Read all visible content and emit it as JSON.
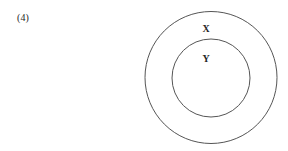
{
  "figure": {
    "item_number": "(4)",
    "background_color": "#ffffff",
    "stroke_color": "#555555",
    "label_color": "#262626",
    "stroke_width": 1,
    "width": 288,
    "height": 151
  },
  "chart_data": {
    "type": "diagram",
    "diagram_kind": "venn",
    "title": "",
    "relation": "subset",
    "sets": [
      {
        "name": "outer-set",
        "label": "X",
        "cx": 211,
        "cy": 77.5,
        "r": 66,
        "label_x": 206,
        "label_y": 30
      },
      {
        "name": "inner-set",
        "label": "Y",
        "cx": 211,
        "cy": 78,
        "r": 39,
        "label_x": 206,
        "label_y": 60
      }
    ],
    "annotations": [
      "(4)"
    ]
  }
}
